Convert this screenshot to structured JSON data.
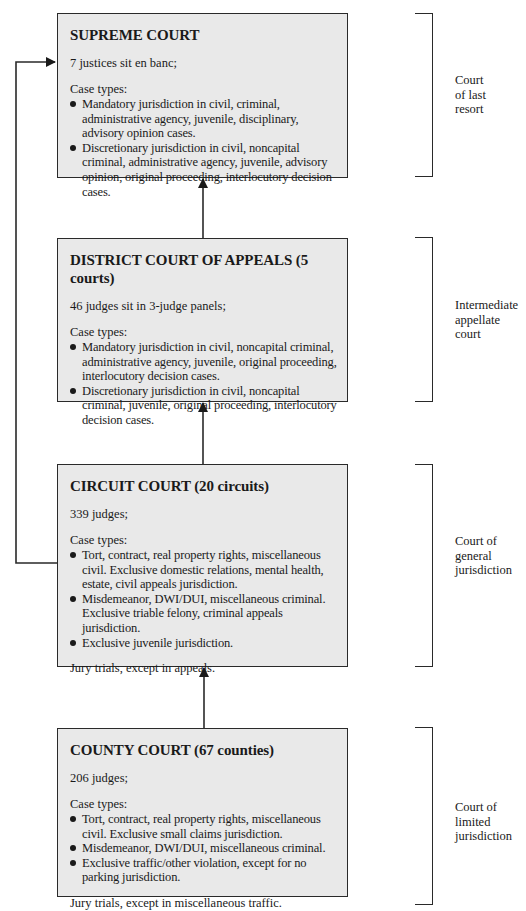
{
  "courts": [
    {
      "title": "SUPREME COURT",
      "judges": "7 justices sit en banc;",
      "case_label": "Case types:",
      "case_types": [
        "Mandatory jurisdiction in civil, criminal, administrative agency, juvenile, disciplinary, advisory opinion cases.",
        "Discretionary jurisdiction in civil, noncapital criminal, administrative agency, juvenile, advisory opinion, original proceeding, interlocutory decision cases."
      ],
      "note": "",
      "tier_label": "Court\nof last\nresort"
    },
    {
      "title": "DISTRICT COURT OF APPEALS (5 courts)",
      "judges": "46 judges sit in 3-judge panels;",
      "case_label": "Case types:",
      "case_types": [
        "Mandatory jurisdiction in civil, noncapital criminal, administrative agency, juvenile, original proceeding, interlocutory decision cases.",
        "Discretionary jurisdiction in civil, noncapital criminal, juvenile, original proceeding, interlocutory decision cases."
      ],
      "note": "",
      "tier_label": "Intermediate\nappellate\ncourt"
    },
    {
      "title": "CIRCUIT COURT (20 circuits)",
      "judges": "339 judges;",
      "case_label": "Case types:",
      "case_types": [
        "Tort, contract, real property rights, miscellaneous civil. Exclusive domestic relations, mental health, estate, civil appeals jurisdiction.",
        "Misdemeanor, DWI/DUI, miscellaneous criminal. Exclusive triable felony, criminal appeals jurisdiction.",
        "Exclusive juvenile jurisdiction."
      ],
      "note": "Jury trials, except in appeals.",
      "tier_label": "Court of\ngeneral\njurisdiction"
    },
    {
      "title": "COUNTY COURT (67 counties)",
      "judges": "206 judges;",
      "case_label": "Case types:",
      "case_types": [
        "Tort, contract, real property rights, miscellaneous civil. Exclusive small claims jurisdiction.",
        "Misdemeanor, DWI/DUI, miscellaneous criminal.",
        "Exclusive traffic/other violation, except for no parking jurisdiction."
      ],
      "note": "Jury trials, except in miscellaneous traffic.",
      "tier_label": "Court of\nlimited\njurisdiction"
    }
  ],
  "colors": {
    "box_fill": "#e9e9e9",
    "line": "#2a2a2a",
    "text": "#1a1a1a"
  }
}
